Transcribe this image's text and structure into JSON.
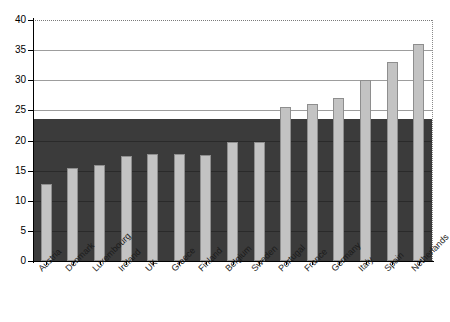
{
  "chart_data": {
    "type": "bar",
    "title": "",
    "subtitle": "",
    "xlabel": "",
    "ylabel": "",
    "ylim": [
      0,
      40
    ],
    "yticks": [
      0,
      5,
      10,
      15,
      20,
      25,
      30,
      35,
      40
    ],
    "ytick_labels": [
      "0",
      "5",
      "10",
      "15",
      "20",
      "25",
      "30",
      "35",
      "40"
    ],
    "grid": true,
    "legend": "none",
    "categories": [
      "Austria",
      "Denmark",
      "Luxembourg",
      "Ireland",
      "UK",
      "Greece",
      "Finland",
      "Belgium",
      "Sweden",
      "Portugal",
      "France",
      "Germany",
      "Italy",
      "Spain",
      "Netherlands"
    ],
    "values": [
      12.8,
      15.5,
      16.0,
      17.5,
      17.7,
      17.7,
      17.6,
      19.8,
      19.8,
      25.5,
      26.1,
      27.1,
      30.0,
      33.0,
      36.0
    ],
    "annotations": [
      {
        "name": "shaded-band",
        "description": "dark shaded region from 0 to 23.5",
        "from": 0,
        "to": 23.5
      },
      {
        "name": "top-dotted-line",
        "description": "dotted boundary at top of plot",
        "value": 40
      }
    ],
    "colors": {
      "bar_fill": "#c3c3c3",
      "bar_edge": "#8e8e8e",
      "shaded_band": "#3b3b3b",
      "gridline": "#9d9d9d",
      "band_gridline": "#2a2a2a",
      "axis": "#000000",
      "label_text": "#1a1a1a",
      "plot_background": "#ffffff"
    }
  }
}
